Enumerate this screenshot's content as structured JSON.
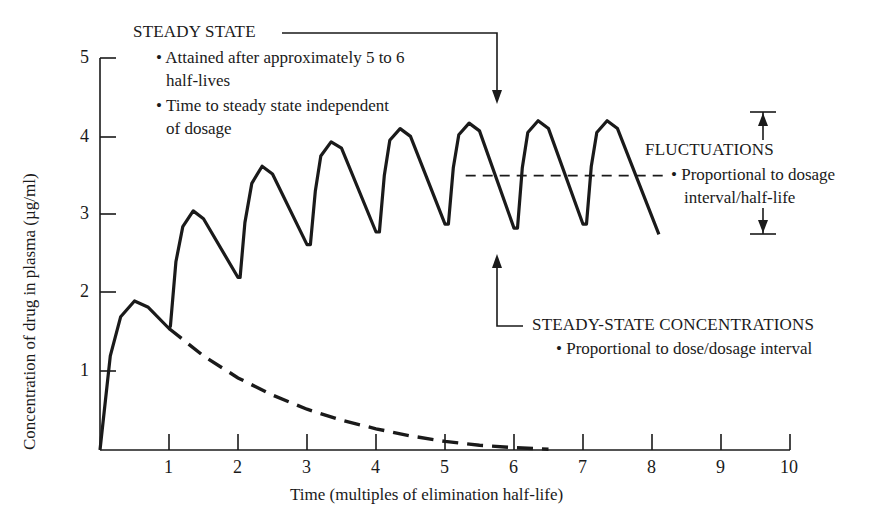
{
  "chart_data": {
    "type": "line",
    "title": "",
    "xlabel": "Time (multiples of elimination half-life)",
    "ylabel": "Concentration of drug in plasma (µg/ml)",
    "xlim": [
      0,
      10
    ],
    "ylim": [
      0,
      5
    ],
    "x_ticks": [
      "1",
      "2",
      "3",
      "4",
      "5",
      "6",
      "7",
      "8",
      "9",
      "10"
    ],
    "y_ticks": [
      "1",
      "2",
      "3",
      "4",
      "5"
    ],
    "grid": false,
    "series": [
      {
        "name": "Repeated dosing (dose every half-life)",
        "style": "solid",
        "points": [
          [
            0,
            0
          ],
          [
            0.15,
            1.2
          ],
          [
            0.3,
            1.7
          ],
          [
            0.5,
            1.9
          ],
          [
            0.7,
            1.82
          ],
          [
            1.0,
            1.55
          ],
          [
            1.02,
            1.58
          ],
          [
            1.1,
            2.4
          ],
          [
            1.2,
            2.85
          ],
          [
            1.35,
            3.05
          ],
          [
            1.5,
            2.95
          ],
          [
            2.0,
            2.2
          ],
          [
            2.03,
            2.2
          ],
          [
            2.1,
            2.9
          ],
          [
            2.2,
            3.4
          ],
          [
            2.35,
            3.62
          ],
          [
            2.5,
            3.52
          ],
          [
            3.0,
            2.62
          ],
          [
            3.05,
            2.62
          ],
          [
            3.12,
            3.3
          ],
          [
            3.2,
            3.75
          ],
          [
            3.35,
            3.93
          ],
          [
            3.5,
            3.85
          ],
          [
            4.0,
            2.78
          ],
          [
            4.05,
            2.78
          ],
          [
            4.12,
            3.5
          ],
          [
            4.2,
            3.95
          ],
          [
            4.35,
            4.1
          ],
          [
            4.5,
            4.0
          ],
          [
            5.0,
            2.88
          ],
          [
            5.05,
            2.88
          ],
          [
            5.12,
            3.6
          ],
          [
            5.2,
            4.02
          ],
          [
            5.35,
            4.17
          ],
          [
            5.5,
            4.07
          ],
          [
            6.0,
            2.83
          ],
          [
            6.05,
            2.83
          ],
          [
            6.12,
            3.6
          ],
          [
            6.2,
            4.05
          ],
          [
            6.35,
            4.2
          ],
          [
            6.5,
            4.1
          ],
          [
            7.0,
            2.88
          ],
          [
            7.05,
            2.88
          ],
          [
            7.12,
            3.62
          ],
          [
            7.2,
            4.05
          ],
          [
            7.35,
            4.2
          ],
          [
            7.5,
            4.1
          ],
          [
            8.1,
            2.75
          ]
        ]
      },
      {
        "name": "Single dose decay",
        "style": "dashed",
        "points": [
          [
            1.0,
            1.55
          ],
          [
            1.5,
            1.2
          ],
          [
            2.0,
            0.92
          ],
          [
            2.5,
            0.7
          ],
          [
            3.0,
            0.52
          ],
          [
            3.5,
            0.38
          ],
          [
            4.0,
            0.27
          ],
          [
            4.5,
            0.18
          ],
          [
            5.0,
            0.11
          ],
          [
            5.5,
            0.06
          ],
          [
            6.0,
            0.03
          ],
          [
            6.5,
            0.01
          ]
        ]
      },
      {
        "name": "Steady-state mean",
        "style": "dashed",
        "points": [
          [
            5.3,
            3.5
          ],
          [
            8.25,
            3.5
          ]
        ]
      }
    ],
    "annotations": [
      {
        "title": "STEADY STATE",
        "bullets": [
          "Attained after approximately 5 to 6 half-lives",
          "Time to steady state independent of dosage"
        ],
        "arrow_to": [
          5.7,
          4.45
        ]
      },
      {
        "title": "FLUCTUATIONS",
        "bullets": [
          "Proportional to dosage interval/half-life"
        ],
        "range": [
          2.75,
          4.3
        ]
      },
      {
        "title": "STEADY-STATE CONCENTRATIONS",
        "bullets": [
          "Proportional to dose/dosage interval"
        ],
        "arrow_to": [
          5.7,
          2.6
        ]
      }
    ]
  },
  "labels": {
    "ylabel": "Concentration of drug in plasma (µg/ml)",
    "xlabel": "Time (multiples of elimination half-life)",
    "x_ticks": [
      "1",
      "2",
      "3",
      "4",
      "5",
      "6",
      "7",
      "8",
      "9",
      "10"
    ],
    "y_ticks": [
      "1",
      "2",
      "3",
      "4",
      "5"
    ],
    "steady_state": {
      "title": "STEADY STATE",
      "b1_l1": "• Attained after approximately 5 to 6",
      "b1_l2": "half-lives",
      "b2_l1": "• Time to steady state independent",
      "b2_l2": "of dosage"
    },
    "fluctuations": {
      "title": "FLUCTUATIONS",
      "b1_l1": "• Proportional to dosage",
      "b1_l2": "interval/half-life"
    },
    "ss_conc": {
      "title": "STEADY-STATE CONCENTRATIONS",
      "b1": "• Proportional to dose/dosage interval"
    }
  }
}
